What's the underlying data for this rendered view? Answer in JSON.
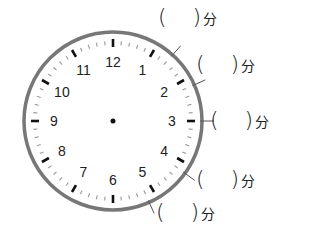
{
  "clock": {
    "center": [
      113,
      121
    ],
    "radius": 89,
    "rim_color": "#777777",
    "numbers": [
      "12",
      "1",
      "2",
      "3",
      "4",
      "5",
      "6",
      "7",
      "8",
      "9",
      "10",
      "11"
    ]
  },
  "answer_blanks": [
    {
      "minute_mark": 7,
      "open": "(",
      "close": ")",
      "unit": "分",
      "x": 158,
      "y": 4
    },
    {
      "minute_mark": 11,
      "open": "(",
      "close": ")",
      "unit": "分",
      "x": 196,
      "y": 51
    },
    {
      "minute_mark": 15,
      "open": "(",
      "close": ")",
      "unit": "分",
      "x": 210,
      "y": 107
    },
    {
      "minute_mark": 21,
      "open": "(",
      "close": ")",
      "unit": "分",
      "x": 196,
      "y": 166
    },
    {
      "minute_mark": 26,
      "open": "(",
      "close": ")",
      "unit": "分",
      "x": 156,
      "y": 199
    }
  ]
}
